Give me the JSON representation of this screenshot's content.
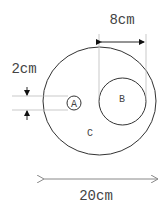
{
  "diagram": {
    "labels": {
      "a": "A",
      "b": "B",
      "c": "C",
      "dim_small": "2cm",
      "dim_b": "8cm",
      "dim_outer": "20cm"
    },
    "colors": {
      "stroke": "#333333",
      "guide": "#bbbbbb",
      "text": "#444444"
    }
  }
}
